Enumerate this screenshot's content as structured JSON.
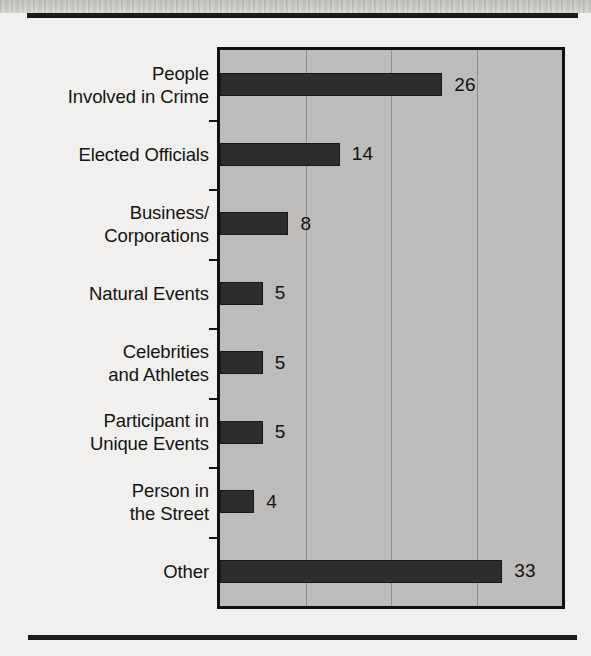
{
  "page": {
    "background_color": "#f1f0ee",
    "rule_color": "#1b1b1b"
  },
  "chart_style": {
    "plot_background": "#bdbcba",
    "bar_color": "#2e2d2c",
    "gridline_color": "#8e8d8b",
    "axis_color": "#111111",
    "text_color": "#131313"
  },
  "chart_data": {
    "type": "bar",
    "orientation": "horizontal",
    "title": "",
    "subtitle": "",
    "xlabel": "",
    "ylabel": "",
    "categories": [
      "People\nInvolved in Crime",
      "Elected Officials",
      "Business/\nCorporations",
      "Natural Events",
      "Celebrities\nand Athletes",
      "Participant in\nUnique Events",
      "Person in\nthe Street",
      "Other"
    ],
    "values": [
      26,
      14,
      8,
      5,
      5,
      5,
      4,
      33
    ],
    "value_labels": [
      "26",
      "14",
      "8",
      "5",
      "5",
      "5",
      "4",
      "33"
    ],
    "xlim": [
      0,
      40
    ],
    "gridlines": [
      10,
      20,
      30
    ],
    "tick_labels_visible": false,
    "grid": true,
    "legend": false,
    "data_labels": true
  }
}
